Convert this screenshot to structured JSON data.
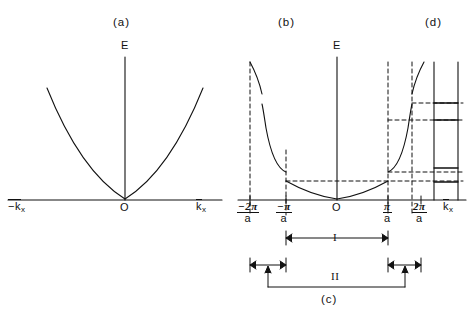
{
  "figure": {
    "background": "#ffffff",
    "stroke": "#111111"
  },
  "panel_a": {
    "tag": "(a)",
    "energy_axis_label": "E",
    "origin_label": "O",
    "x_axis_left_label": "−k",
    "x_axis_left_sub": "x",
    "x_axis_right_label": "k",
    "x_axis_right_sub": "x",
    "curve_description": "free-electron parabola E ∝ k²"
  },
  "panel_b": {
    "tag": "(b)",
    "energy_axis_label": "E",
    "origin_label": "O",
    "x_axis_label": "k",
    "x_axis_sub": "x",
    "ticks": [
      {
        "id": "minus-2pi-a",
        "num": "−2π",
        "den": "a",
        "x": 250
      },
      {
        "id": "minus-pi-a",
        "num": "−π",
        "den": "a",
        "x": 286
      },
      {
        "id": "origin",
        "num": "O",
        "den": "",
        "x": 337
      },
      {
        "id": "pi-a",
        "num": "π",
        "den": "a",
        "x": 388
      },
      {
        "id": "2pi-a",
        "num": "2π",
        "den": "a",
        "x": 421
      }
    ],
    "curve_description": "nearly-free-electron bands with gaps opening at ±π/a and ±2π/a"
  },
  "panel_c": {
    "tag": "(c)",
    "zone_1_label": "I",
    "zone_2_label": "II",
    "zone_1_description": "first Brillouin zone, −π/a to π/a",
    "zone_2_description": "second Brillouin zone, two segments −2π/a to −π/a and π/a to 2π/a"
  },
  "panel_d": {
    "tag": "(d)",
    "description": "reduced energy band edges: allowed bands and forbidden gaps",
    "bands": [
      {
        "id": "band-edge-1",
        "y": 103
      },
      {
        "id": "band-edge-2",
        "y": 120
      },
      {
        "id": "band-edge-3",
        "y": 168
      },
      {
        "id": "band-edge-4",
        "y": 182
      }
    ]
  }
}
